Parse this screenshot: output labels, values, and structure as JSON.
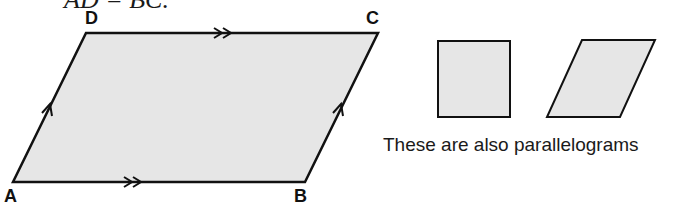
{
  "header": {
    "partial_text": "AD = BC."
  },
  "main_figure": {
    "vertices": [
      {
        "label": "A",
        "x": 13,
        "y": 182
      },
      {
        "label": "B",
        "x": 305,
        "y": 182
      },
      {
        "label": "C",
        "x": 378,
        "y": 33
      },
      {
        "label": "D",
        "x": 86,
        "y": 33
      }
    ],
    "fill_color": "#e6e6e6",
    "stroke_color": "#111111",
    "markers": {
      "AB": "double-arrow",
      "DC": "double-arrow",
      "AD": "single-arrow",
      "BC": "single-arrow"
    }
  },
  "examples": {
    "shapes": [
      "rectangle",
      "rhombus-parallelogram"
    ],
    "caption": "These are also parallelograms"
  }
}
